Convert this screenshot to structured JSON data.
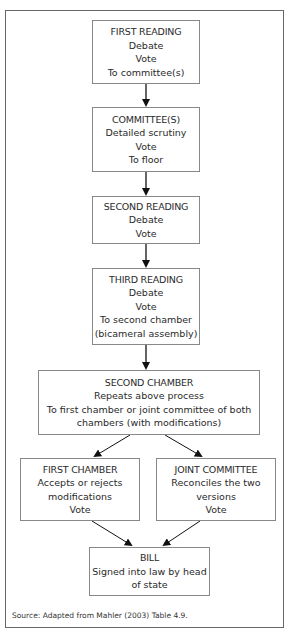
{
  "diagram": {
    "type": "flowchart",
    "boxes": [
      {
        "id": "first-reading",
        "title": "FIRST READING",
        "lines": [
          "Debate",
          "Vote",
          "To committee(s)"
        ]
      },
      {
        "id": "committees",
        "title": "COMMITTEE(S)",
        "lines": [
          "Detailed scrutiny",
          "Vote",
          "To floor"
        ]
      },
      {
        "id": "second-reading",
        "title": "SECOND READING",
        "lines": [
          "Debate",
          "Vote"
        ]
      },
      {
        "id": "third-reading",
        "title": "THIRD READING",
        "lines": [
          "Debate",
          "Vote",
          "To second chamber",
          "(bicameral assembly)"
        ]
      },
      {
        "id": "second-chamber",
        "title": "SECOND CHAMBER",
        "lines": [
          "Repeats above process",
          "To first chamber or joint committee of both",
          "chambers (with modifications)"
        ]
      },
      {
        "id": "first-chamber",
        "title": "FIRST CHAMBER",
        "lines": [
          "Accepts or rejects",
          "modifications",
          "Vote"
        ]
      },
      {
        "id": "joint-committee",
        "title": "JOINT COMMITTEE",
        "lines": [
          "Reconciles the two",
          "versions",
          "Vote"
        ]
      },
      {
        "id": "bill",
        "title": "BILL",
        "lines": [
          "Signed into law by head",
          "of state"
        ]
      }
    ],
    "edges": [
      [
        "first-reading",
        "committees"
      ],
      [
        "committees",
        "second-reading"
      ],
      [
        "second-reading",
        "third-reading"
      ],
      [
        "third-reading",
        "second-chamber"
      ],
      [
        "second-chamber",
        "first-chamber"
      ],
      [
        "second-chamber",
        "joint-committee"
      ],
      [
        "first-chamber",
        "bill"
      ],
      [
        "joint-committee",
        "bill"
      ]
    ],
    "source": "Source:  Adapted from Mahler (2003) Table 4.9."
  }
}
